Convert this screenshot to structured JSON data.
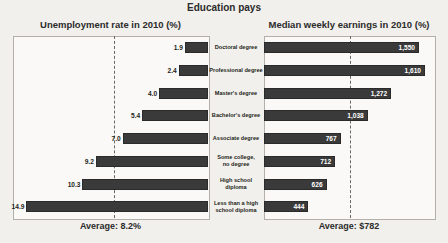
{
  "title": "Education pays",
  "left_panel": {
    "header": "Unemployment rate in 2010 (%)",
    "average_label": "Average: 8.2%"
  },
  "right_panel": {
    "header": "Median weekly earnings in 2010 (%)",
    "average_label": "Average: $782"
  },
  "chart_data": {
    "type": "bar",
    "title": "Education pays",
    "categories": [
      "Doctoral degree",
      "Professional degree",
      "Master's degree",
      "Bachelor's degree",
      "Associate degree",
      "Some college,\nno degree",
      "High school\ndiploma",
      "Less than a high\nschool diploma"
    ],
    "series": [
      {
        "name": "Unemployment rate in 2010 (%)",
        "xlabel": "Unemployment rate in 2010 (%)",
        "direction": "left",
        "values": [
          1.9,
          2.4,
          4.0,
          5.4,
          7.0,
          9.2,
          10.3,
          14.9
        ],
        "labels": [
          "1.9",
          "2.4",
          "4.0",
          "5.4",
          "7.0",
          "9.2",
          "10.3",
          "14.9"
        ],
        "average": 8.2,
        "average_label": "Average: 8.2%",
        "xlim": [
          0,
          16
        ]
      },
      {
        "name": "Median weekly earnings in 2010 (%)",
        "xlabel": "Median weekly earnings in 2010 (%)",
        "direction": "right",
        "values": [
          1550,
          1610,
          1272,
          1038,
          767,
          712,
          626,
          444
        ],
        "labels": [
          "1,550",
          "1,610",
          "1,272",
          "1,038",
          "767",
          "712",
          "626",
          "444"
        ],
        "average": 782,
        "average_label": "Average: $782",
        "xlim": [
          0,
          1700
        ]
      }
    ],
    "grid": false,
    "legend": "none",
    "colors": {
      "bar": "#3a3a3a",
      "panel_background": "#faf9f7",
      "page_background": "#f2f0ec",
      "average_line": "#6b6762"
    }
  }
}
